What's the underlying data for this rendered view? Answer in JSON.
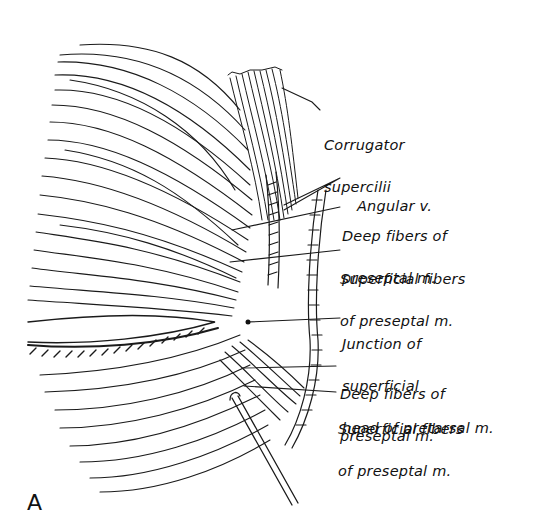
{
  "figure": {
    "panel_letter": "A",
    "labels": [
      {
        "id": "corrugator",
        "line1": "Corrugator",
        "line2": "supercilii",
        "line3": ""
      },
      {
        "id": "angular-v",
        "line1": "Angular v.",
        "line2": "",
        "line3": ""
      },
      {
        "id": "deep-upper",
        "line1": "Deep fibers of",
        "line2": "preseptal m.",
        "line3": ""
      },
      {
        "id": "superficial-upper",
        "line1": "Superficial fibers",
        "line2": "of preseptal m.",
        "line3": ""
      },
      {
        "id": "junction",
        "line1": "Junction of",
        "line2": "superficial",
        "line3": "head of pretarsal m."
      },
      {
        "id": "deep-lower",
        "line1": "Deep fibers of",
        "line2": "preseptal m.",
        "line3": ""
      },
      {
        "id": "superficial-lower",
        "line1": "Superficial fibers",
        "line2": "of preseptal m.",
        "line3": ""
      }
    ]
  }
}
